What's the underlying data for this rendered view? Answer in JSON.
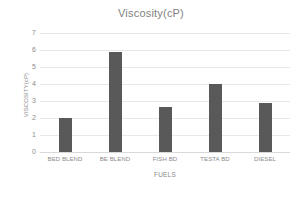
{
  "chart_data": {
    "type": "bar",
    "title": "Viscosity(cP)",
    "xlabel": "FUELS",
    "ylabel": "VISCOSITY(cP)",
    "categories": [
      "BED BLEND",
      "BE BLEND",
      "FISH BD",
      "TESTA BD",
      "DIESEL"
    ],
    "values": [
      2.0,
      5.9,
      2.65,
      4.0,
      2.9
    ],
    "ylim": [
      0,
      7
    ],
    "yticks": [
      0,
      1,
      2,
      3,
      4,
      5,
      6,
      7
    ],
    "ytick_labels": [
      "0",
      "1",
      "2",
      "3",
      "4",
      "5",
      "6",
      "7"
    ],
    "grid": true,
    "legend": false,
    "series_color": "#595959",
    "gridline_color": "#e8e8e8",
    "text_color": "#8a8a8a",
    "background": "#ffffff"
  }
}
